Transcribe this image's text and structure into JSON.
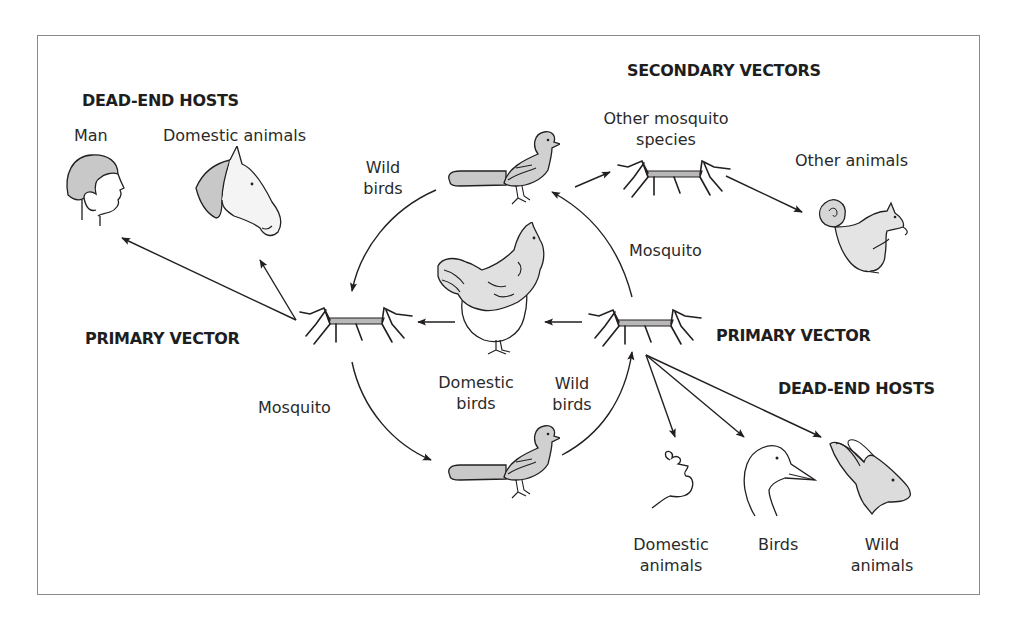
{
  "diagram": {
    "colors": {
      "ink": "#231f20",
      "fill": "#c8c8c8",
      "fill_light": "#e2e2e2",
      "frame": "#8a8a8a"
    },
    "headings": {
      "dead_end_hosts_left": "DEAD-END HOSTS",
      "secondary_vectors": "SECONDARY VECTORS",
      "primary_vector_left": "PRIMARY VECTOR",
      "primary_vector_right": "PRIMARY VECTOR",
      "dead_end_hosts_right": "DEAD-END HOSTS"
    },
    "nodes": {
      "man": "Man",
      "domestic_animals_top": "Domestic animals",
      "wild_birds_top_l1": "Wild",
      "wild_birds_top_l2": "birds",
      "other_mosquito_l1": "Other mosquito",
      "other_mosquito_l2": "species",
      "other_animals": "Other animals",
      "mosquito_right": "Mosquito",
      "mosquito_left": "Mosquito",
      "domestic_birds_l1": "Domestic",
      "domestic_birds_l2": "birds",
      "wild_birds_bottom_l1": "Wild",
      "wild_birds_bottom_l2": "birds",
      "domestic_animals_bottom_l1": "Domestic",
      "domestic_animals_bottom_l2": "animals",
      "birds": "Birds",
      "wild_animals_l1": "Wild",
      "wild_animals_l2": "animals"
    },
    "edges": [
      {
        "from": "primary-vector-left",
        "to": "man"
      },
      {
        "from": "primary-vector-left",
        "to": "domestic-animals-top"
      },
      {
        "from": "wild-bird-top",
        "to": "primary-vector-left"
      },
      {
        "from": "primary-vector-left",
        "to": "wild-bird-bottom"
      },
      {
        "from": "wild-bird-bottom",
        "to": "primary-vector-right"
      },
      {
        "from": "primary-vector-right",
        "to": "wild-bird-top"
      },
      {
        "from": "primary-vector-right",
        "to": "domestic-bird"
      },
      {
        "from": "domestic-bird",
        "to": "primary-vector-left"
      },
      {
        "from": "wild-bird-top",
        "to": "other-mosquito-species"
      },
      {
        "from": "other-mosquito-species",
        "to": "other-animals"
      },
      {
        "from": "primary-vector-right",
        "to": "domestic-animals-bottom"
      },
      {
        "from": "primary-vector-right",
        "to": "birds"
      },
      {
        "from": "primary-vector-right",
        "to": "wild-animals"
      }
    ]
  }
}
